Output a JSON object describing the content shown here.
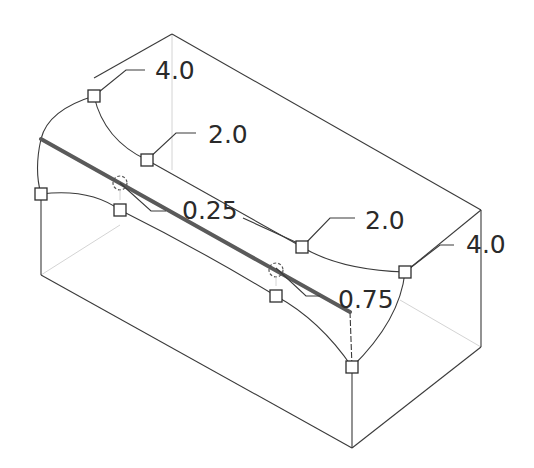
{
  "diagram": {
    "type": "variable-radius-round-preview",
    "colors": {
      "edge": "#3a3a3a",
      "selected_edge": "#5a5a5a",
      "background": "#ffffff"
    },
    "radius_labels": [
      {
        "id": "r1",
        "value": "4.0"
      },
      {
        "id": "r2",
        "value": "2.0"
      },
      {
        "id": "r3",
        "value": "2.0"
      },
      {
        "id": "r4",
        "value": "4.0"
      }
    ],
    "position_labels": [
      {
        "id": "p1",
        "value": "0.25"
      },
      {
        "id": "p2",
        "value": "0.75"
      }
    ]
  }
}
